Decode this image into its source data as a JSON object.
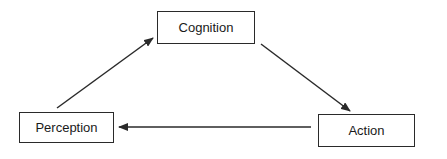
{
  "diagram": {
    "type": "cycle",
    "nodes": [
      {
        "id": "cognition",
        "label": "Cognition"
      },
      {
        "id": "action",
        "label": "Action"
      },
      {
        "id": "perception",
        "label": "Perception"
      }
    ],
    "edges": [
      {
        "from": "perception",
        "to": "cognition"
      },
      {
        "from": "cognition",
        "to": "action"
      },
      {
        "from": "action",
        "to": "perception"
      }
    ],
    "colors": {
      "stroke": "#2a2a2a",
      "background": "#ffffff",
      "text": "#1a1a1a"
    }
  }
}
